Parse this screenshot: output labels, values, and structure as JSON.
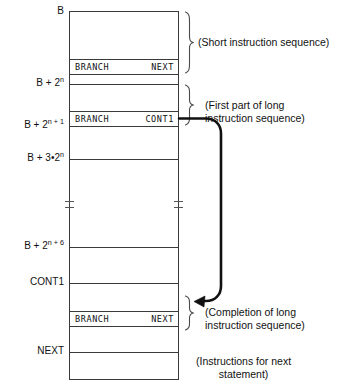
{
  "figure": {
    "line_color": "#3a3a3a",
    "text_color": "#111111",
    "background": "#ffffff"
  },
  "address_labels": [
    {
      "id": "addr-b",
      "text": "B",
      "kind": "symbol"
    },
    {
      "id": "addr-b-2n",
      "base": "B + 2",
      "exponent": "n",
      "kind": "expression"
    },
    {
      "id": "addr-b-2n1",
      "base": "B + 2",
      "exponent": "n + 1",
      "kind": "expression"
    },
    {
      "id": "addr-b-3x2n",
      "base": "B + 3•2",
      "exponent": "n",
      "kind": "expression"
    },
    {
      "id": "addr-b-2n6",
      "base": "B + 2",
      "exponent": "n + 6",
      "kind": "expression"
    },
    {
      "id": "addr-cont1",
      "text": "CONT1",
      "kind": "symbol"
    },
    {
      "id": "addr-next",
      "text": "NEXT",
      "kind": "symbol"
    }
  ],
  "instruction_cells": [
    {
      "id": "cell-branch-next-top",
      "opcode": "BRANCH",
      "operand": "NEXT"
    },
    {
      "id": "cell-branch-cont1",
      "opcode": "BRANCH",
      "operand": "CONT1"
    },
    {
      "id": "cell-branch-next-bottom",
      "opcode": "BRANCH",
      "operand": "NEXT"
    }
  ],
  "annotations": [
    {
      "id": "note-short",
      "text": "(Short instruction sequence)"
    },
    {
      "id": "note-first-part",
      "text": "(First part of long\ninstruction sequence)"
    },
    {
      "id": "note-completion",
      "text": "(Completion of long\ninstruction sequence)"
    },
    {
      "id": "note-next-stmt",
      "text": "(Instructions for next\nstatement)"
    }
  ]
}
